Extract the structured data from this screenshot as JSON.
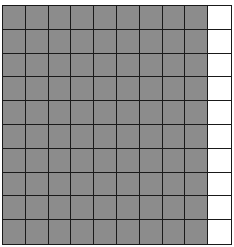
{
  "grid": {
    "rows": 10,
    "columns": 10,
    "shaded_columns": 9,
    "shaded_cells": 90,
    "total_cells": 100,
    "shaded_color": "#8c8c8c",
    "empty_color": "#ffffff",
    "line_color": "#1a1a1a"
  }
}
